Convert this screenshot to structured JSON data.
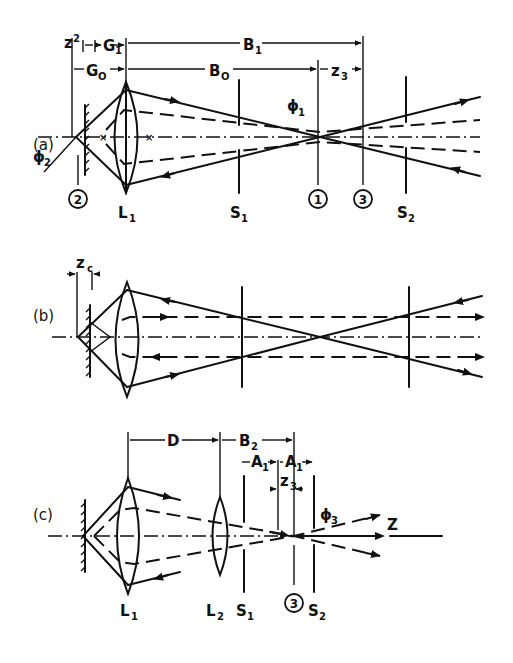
{
  "figure": {
    "panels": [
      {
        "id": "a",
        "label": "(a)",
        "dimensions": [
          "z₂",
          "G₁",
          "B₁",
          "G₀",
          "B₀",
          "z₃"
        ],
        "components": [
          "L₁",
          "S₁",
          "S₂"
        ],
        "markers": [
          "2",
          "1",
          "3"
        ],
        "angles": [
          "φ₁",
          "φ₂"
        ]
      },
      {
        "id": "b",
        "label": "(b)",
        "dimensions": [
          "z_c"
        ],
        "components": [],
        "markers": [],
        "angles": []
      },
      {
        "id": "c",
        "label": "(c)",
        "dimensions": [
          "D",
          "B₂",
          "A₁",
          "A₁",
          "z₃"
        ],
        "components": [
          "L₁",
          "L₂",
          "S₁",
          "S₂"
        ],
        "markers": [
          "3"
        ],
        "angles": [
          "φ₃"
        ],
        "axis_label": "Z"
      }
    ]
  },
  "labels": {
    "a": {
      "panel": "(a)",
      "z2": "z",
      "z2_sub": "2",
      "G1": "G",
      "G1_sub": "1",
      "B1": "B",
      "B1_sub": "1",
      "G0": "G",
      "G0_sub": "O",
      "B0": "B",
      "B0_sub": "O",
      "z3": "z",
      "z3_sub": "3",
      "phi1": "ϕ",
      "phi1_sub": "1",
      "phi2": "ϕ",
      "phi2_sub": "2",
      "L1": "L",
      "L1_sub": "1",
      "S1": "S",
      "S1_sub": "1",
      "S2": "S",
      "S2_sub": "2",
      "m2": "2",
      "m1": "1",
      "m3": "3"
    },
    "b": {
      "panel": "(b)",
      "zc": "z",
      "zc_sub": "c"
    },
    "c": {
      "panel": "(c)",
      "D": "D",
      "B2": "B",
      "B2_sub": "2",
      "A1a": "A",
      "A1a_sub": "1",
      "A1b": "A",
      "A1b_sub": "1",
      "z3": "z",
      "z3_sub": "3",
      "phi3": "ϕ",
      "phi3_sub": "3",
      "Z": "Z",
      "L1": "L",
      "L1_sub": "1",
      "L2": "L",
      "L2_sub": "2",
      "S1": "S",
      "S1_sub": "1",
      "S2": "S",
      "S2_sub": "2",
      "m3": "3"
    }
  }
}
